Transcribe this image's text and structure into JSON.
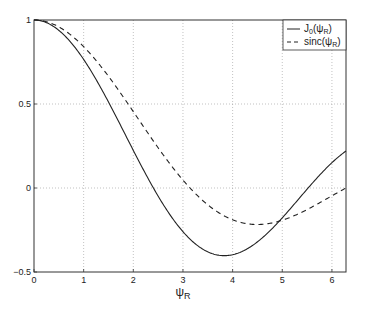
{
  "chart_data": {
    "type": "line",
    "title": "",
    "xlabel": "ψ_R",
    "ylabel": "",
    "xlim": [
      0,
      6.2832
    ],
    "ylim": [
      -0.5,
      1
    ],
    "grid": true,
    "legend_position": "upper right",
    "x_ticks": [
      "0",
      "1",
      "2",
      "3",
      "4",
      "5",
      "6"
    ],
    "y_ticks": [
      "-0.5",
      "0",
      "0.5",
      "1"
    ],
    "series": [
      {
        "name": "J_0(ψ_R)",
        "style": "solid",
        "x": [
          0,
          0.5,
          1.0,
          1.5,
          2.0,
          2.405,
          3.0,
          3.5,
          3.832,
          4.0,
          4.5,
          5.0,
          5.52,
          6.0,
          6.2832
        ],
        "values": [
          1.0,
          0.938,
          0.765,
          0.512,
          0.224,
          0.0,
          -0.26,
          -0.38,
          -0.403,
          -0.397,
          -0.321,
          -0.178,
          0.0,
          0.151,
          0.202
        ]
      },
      {
        "name": "sinc(ψ_R)",
        "style": "dashed",
        "x": [
          0,
          0.5,
          1.0,
          1.5,
          2.0,
          2.5,
          3.0,
          3.1416,
          3.5,
          4.0,
          4.4934,
          5.0,
          5.5,
          6.0,
          6.2832
        ],
        "values": [
          1.0,
          0.959,
          0.841,
          0.665,
          0.455,
          0.239,
          0.047,
          0.0,
          -0.1,
          -0.189,
          -0.217,
          -0.192,
          -0.128,
          -0.047,
          0.0
        ]
      }
    ]
  },
  "legend": {
    "items": [
      {
        "label_main": "J",
        "label_sub": "0",
        "label_rest": "(ψ",
        "label_sub2": "R",
        "label_end": ")"
      },
      {
        "label_main": "sinc(ψ",
        "label_sub": "R",
        "label_end": ")"
      }
    ]
  },
  "axes": {
    "xlabel_main": "ψ",
    "xlabel_sub": "R"
  }
}
